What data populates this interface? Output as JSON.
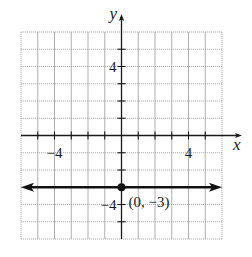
{
  "chart_data": {
    "type": "line",
    "title": "",
    "xlabel": "x",
    "ylabel": "y",
    "xlim": [
      -6,
      6
    ],
    "ylim": [
      -6,
      6
    ],
    "grid": true,
    "x_tick_labels": [
      {
        "value": -4,
        "label": "−4"
      },
      {
        "value": 4,
        "label": "4"
      }
    ],
    "y_tick_labels": [
      {
        "value": 4,
        "label": "4"
      },
      {
        "value": -4,
        "label": "−4"
      }
    ],
    "series": [
      {
        "name": "y = -3",
        "kind": "horizontal-line-with-arrows",
        "x": [
          -6,
          6
        ],
        "y": [
          -3,
          -3
        ]
      }
    ],
    "points": [
      {
        "x": 0,
        "y": -3,
        "label": "(0, −3)"
      }
    ],
    "legend": null
  },
  "colors": {
    "grid": "#9a9a9a",
    "axis": "#1a1a1a",
    "line": "#111111",
    "background": "#ffffff"
  }
}
